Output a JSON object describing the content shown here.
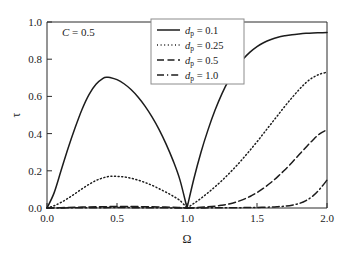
{
  "figure": {
    "background_color": "#ffffff",
    "line_color": "#1c1c1c",
    "axis_color": "#2b2b2b"
  },
  "annotation": {
    "condition_italic": "C",
    "condition_rest": " = 0.5"
  },
  "axes": {
    "x_title": "Ω",
    "y_title": "τ",
    "x_ticks": [
      "0.0",
      "0.5",
      "1.0",
      "1.5",
      "2.0"
    ],
    "y_ticks": [
      "0.0",
      "0.2",
      "0.4",
      "0.6",
      "0.8",
      "1.0"
    ]
  },
  "legend": {
    "entries": [
      {
        "symbol": "d",
        "subscript": "p",
        "value": " = 0.1",
        "style": "solid"
      },
      {
        "symbol": "d",
        "subscript": "p",
        "value": " = 0.25",
        "style": "dotted"
      },
      {
        "symbol": "d",
        "subscript": "p",
        "value": " = 0.5",
        "style": "dashed"
      },
      {
        "symbol": "d",
        "subscript": "p",
        "value": " = 1.0",
        "style": "dashdot"
      }
    ]
  },
  "chart_data": {
    "type": "line",
    "title": "",
    "xlabel": "Ω",
    "ylabel": "τ",
    "xlim": [
      0.0,
      2.0
    ],
    "ylim": [
      0.0,
      1.0
    ],
    "xticks": [
      0.0,
      0.5,
      1.0,
      1.5,
      2.0
    ],
    "yticks": [
      0.0,
      0.2,
      0.4,
      0.6,
      0.8,
      1.0
    ],
    "grid": false,
    "legend_position": "top-center",
    "annotations": [
      {
        "text": "C = 0.5",
        "x": 0.12,
        "y": 0.95
      }
    ],
    "series": [
      {
        "name": "d_p = 0.1",
        "style": "solid",
        "x": [
          0.0,
          0.05,
          0.1,
          0.15,
          0.2,
          0.25,
          0.3,
          0.35,
          0.4,
          0.43,
          0.45,
          0.5,
          0.55,
          0.6,
          0.65,
          0.7,
          0.75,
          0.8,
          0.85,
          0.9,
          0.95,
          1.0,
          1.05,
          1.1,
          1.15,
          1.2,
          1.25,
          1.3,
          1.35,
          1.4,
          1.45,
          1.5,
          1.55,
          1.6,
          1.65,
          1.7,
          1.75,
          1.8,
          1.85,
          1.9,
          1.95,
          2.0
        ],
        "y": [
          0.0,
          0.08,
          0.2,
          0.32,
          0.43,
          0.53,
          0.61,
          0.665,
          0.697,
          0.703,
          0.702,
          0.69,
          0.668,
          0.637,
          0.597,
          0.548,
          0.49,
          0.423,
          0.345,
          0.256,
          0.15,
          0.0,
          0.16,
          0.3,
          0.42,
          0.525,
          0.615,
          0.69,
          0.752,
          0.8,
          0.838,
          0.868,
          0.89,
          0.906,
          0.918,
          0.926,
          0.932,
          0.936,
          0.939,
          0.941,
          0.942,
          0.943
        ]
      },
      {
        "name": "d_p = 0.25",
        "style": "dotted",
        "x": [
          0.0,
          0.05,
          0.1,
          0.15,
          0.2,
          0.25,
          0.3,
          0.35,
          0.4,
          0.45,
          0.5,
          0.55,
          0.6,
          0.65,
          0.7,
          0.75,
          0.8,
          0.85,
          0.9,
          0.95,
          1.0,
          1.05,
          1.1,
          1.15,
          1.2,
          1.25,
          1.3,
          1.35,
          1.4,
          1.45,
          1.5,
          1.55,
          1.6,
          1.65,
          1.7,
          1.75,
          1.8,
          1.85,
          1.9,
          1.95,
          2.0
        ],
        "y": [
          0.0,
          0.012,
          0.03,
          0.052,
          0.077,
          0.103,
          0.127,
          0.148,
          0.162,
          0.17,
          0.17,
          0.167,
          0.16,
          0.15,
          0.137,
          0.122,
          0.104,
          0.085,
          0.064,
          0.04,
          0.0,
          0.025,
          0.052,
          0.082,
          0.114,
          0.148,
          0.185,
          0.224,
          0.266,
          0.31,
          0.356,
          0.404,
          0.452,
          0.5,
          0.548,
          0.593,
          0.636,
          0.674,
          0.702,
          0.72,
          0.73
        ]
      },
      {
        "name": "d_p = 0.5",
        "style": "dashed",
        "x": [
          0.0,
          0.1,
          0.2,
          0.3,
          0.4,
          0.5,
          0.6,
          0.7,
          0.8,
          0.9,
          1.0,
          1.1,
          1.2,
          1.25,
          1.3,
          1.35,
          1.4,
          1.45,
          1.5,
          1.55,
          1.6,
          1.65,
          1.7,
          1.75,
          1.8,
          1.85,
          1.9,
          1.95,
          2.0
        ],
        "y": [
          0.0,
          0.002,
          0.004,
          0.006,
          0.007,
          0.008,
          0.008,
          0.007,
          0.006,
          0.004,
          0.0,
          0.004,
          0.01,
          0.015,
          0.022,
          0.032,
          0.045,
          0.062,
          0.083,
          0.108,
          0.137,
          0.17,
          0.206,
          0.245,
          0.286,
          0.327,
          0.366,
          0.4,
          0.42
        ]
      },
      {
        "name": "d_p = 1.0",
        "style": "dashdot",
        "x": [
          0.0,
          0.2,
          0.4,
          0.6,
          0.8,
          1.0,
          1.2,
          1.4,
          1.5,
          1.6,
          1.65,
          1.7,
          1.75,
          1.8,
          1.85,
          1.9,
          1.95,
          2.0
        ],
        "y": [
          0.0,
          0.001,
          0.002,
          0.002,
          0.001,
          0.0,
          0.001,
          0.002,
          0.003,
          0.005,
          0.007,
          0.01,
          0.015,
          0.024,
          0.04,
          0.065,
          0.103,
          0.15
        ]
      }
    ]
  }
}
